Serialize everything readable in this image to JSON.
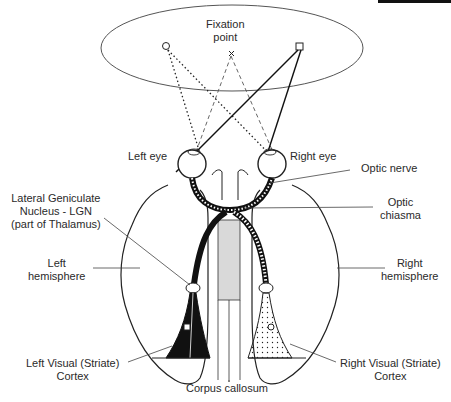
{
  "labels": {
    "fixation_line1": "Fixation",
    "fixation_line2": "point",
    "left_eye": "Left eye",
    "right_eye": "Right eye",
    "optic_nerve": "Optic nerve",
    "optic_chiasma_line1": "Optic",
    "optic_chiasma_line2": "chiasma",
    "lgn_line1": "Lateral Geniculate",
    "lgn_line2": "Nucleus - LGN",
    "lgn_line3": "(part of Thalamus)",
    "left_hemisphere_line1": "Left",
    "left_hemisphere_line2": "hemisphere",
    "right_hemisphere_line1": "Right",
    "right_hemisphere_line2": "hemisphere",
    "left_cortex_line1": "Left Visual (Striate)",
    "left_cortex_line2": "Cortex",
    "right_cortex_line1": "Right Visual (Striate)",
    "right_cortex_line2": "Cortex",
    "corpus_callosum": "Corpus callosum"
  },
  "symbols": {
    "left_target": "circle",
    "center_target": "x",
    "right_target": "square"
  },
  "colors": {
    "line": "#222222",
    "callosum_fill": "#d9d9d9",
    "left_radiation_fill": "#111111",
    "right_radiation_fill": "#ffffff"
  }
}
